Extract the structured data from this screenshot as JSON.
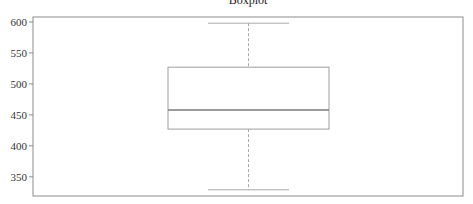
{
  "chart_data": {
    "type": "boxplot",
    "title": "Boxplot",
    "xlabel": "",
    "ylabel": "",
    "ylim": [
      319,
      608
    ],
    "yticks": [
      350,
      400,
      450,
      500,
      550,
      600
    ],
    "ytick_labels": [
      "350",
      "400",
      "450",
      "500",
      "550",
      "600"
    ],
    "grid": false,
    "legend": null,
    "series": [
      {
        "name": "",
        "whisker_low": 329,
        "q1": 427,
        "median": 458,
        "q3": 527,
        "whisker_high": 598
      }
    ]
  },
  "colors": {
    "box_edge": "#9e9e9e",
    "median": "#7a7a7a",
    "whisker": "#a8a8a8",
    "frame": "#8c8c8c",
    "background": "#ffffff"
  }
}
